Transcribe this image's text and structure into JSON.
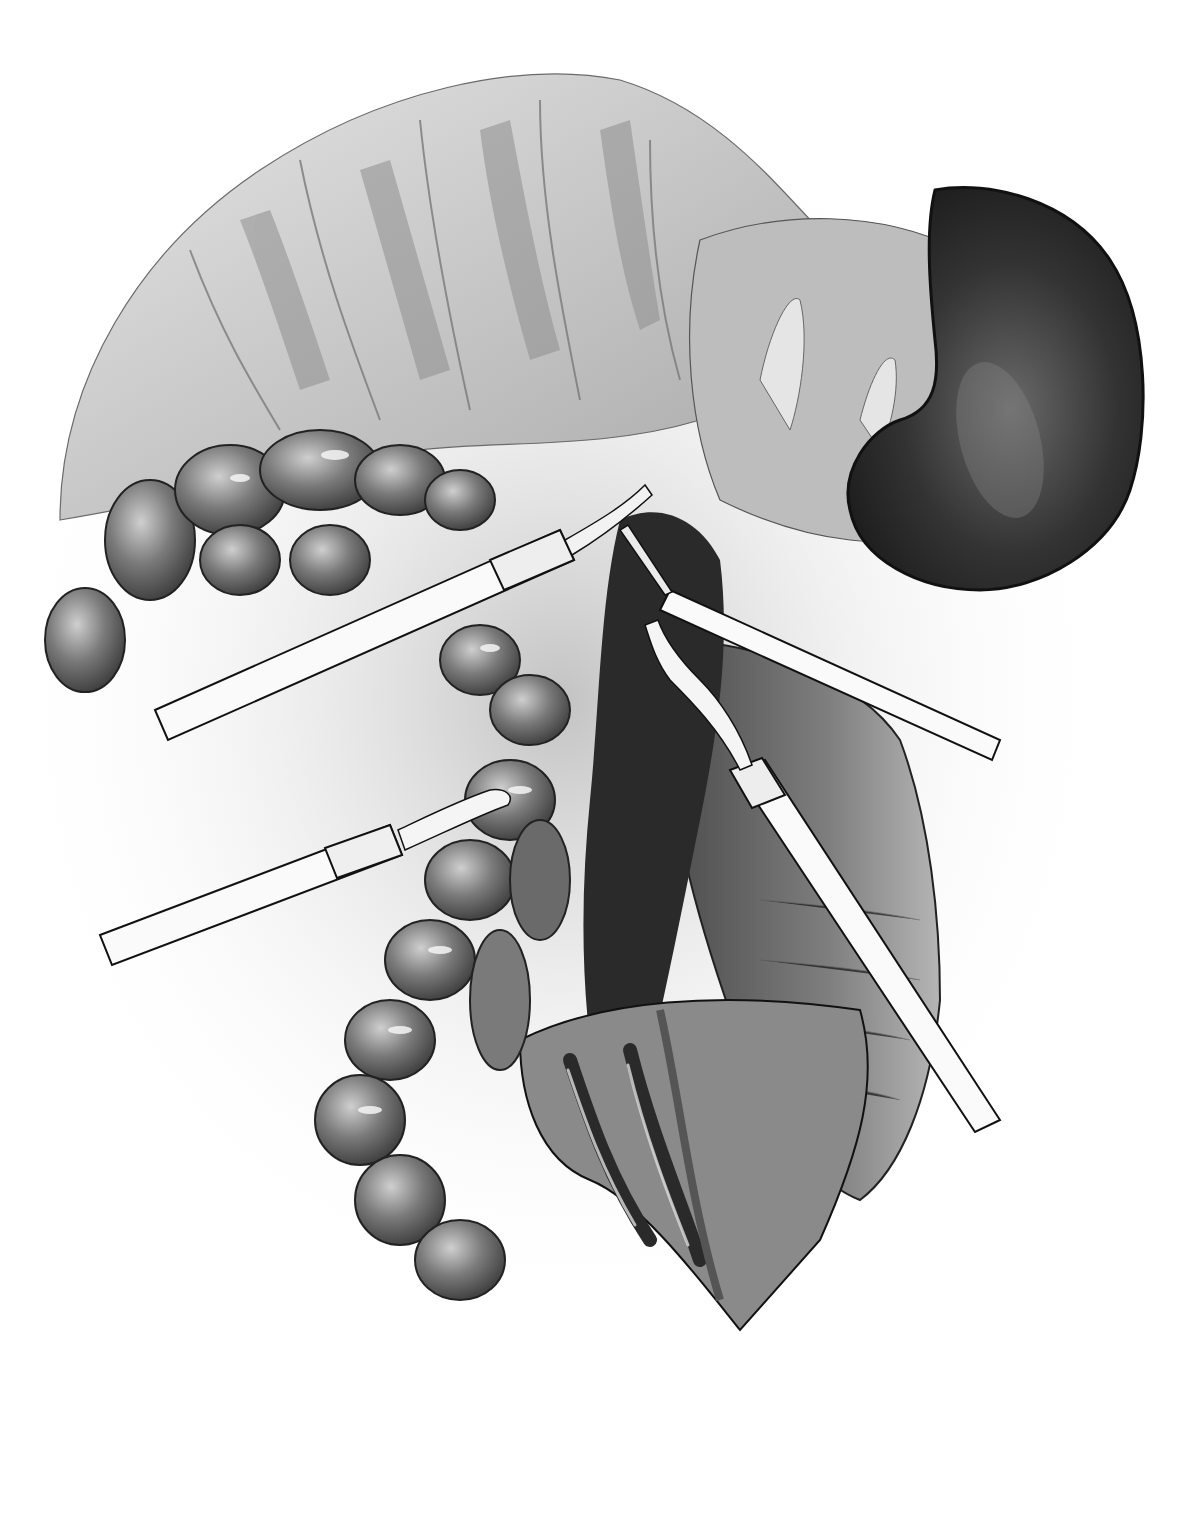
{
  "figure": {
    "description": "Grayscale pencil surgical illustration of a laparoscopic dissection showing colon, kidney, retroperitoneal vessels and four laparoscopic instruments",
    "style": "monochrome pencil drawing",
    "background": "#ffffff",
    "palette": {
      "paper": "#ffffff",
      "light_tissue": "#d9d9d9",
      "mid_tissue": "#9a9a9a",
      "dark_tissue": "#3a3a3a",
      "kidney": "#2b2b2b",
      "instrument": "#fafafa",
      "outline": "#1a1a1a"
    },
    "elements": {
      "omentum": "fatty omentum across top",
      "colon": "haustrated colon curving from left down to bottom center",
      "kidney": "dark kidney upper right",
      "peritoneum_flap": "retracted peritoneal flap right",
      "vessels": "vessels in incision lower center",
      "instruments": [
        {
          "id": "upper-left",
          "type": "grasper"
        },
        {
          "id": "upper-right",
          "type": "dissector"
        },
        {
          "id": "lower-left",
          "type": "grasper"
        },
        {
          "id": "lower-right",
          "type": "retractor"
        }
      ]
    }
  }
}
